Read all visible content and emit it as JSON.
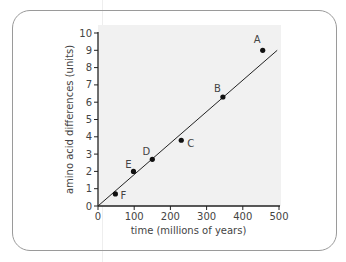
{
  "chart_data": {
    "type": "scatter",
    "title": "",
    "xlabel": "time (millions of years)",
    "ylabel": "amino acid differences (units)",
    "xlim": [
      0,
      500
    ],
    "ylim": [
      0,
      10
    ],
    "xticks": [
      0,
      100,
      200,
      300,
      400,
      500
    ],
    "yticks": [
      0,
      1,
      2,
      3,
      4,
      5,
      6,
      7,
      8,
      9,
      10
    ],
    "grid": false,
    "legend": null,
    "points": [
      {
        "label": "A",
        "x": 455,
        "y": 9.0
      },
      {
        "label": "B",
        "x": 345,
        "y": 6.3
      },
      {
        "label": "C",
        "x": 230,
        "y": 3.8
      },
      {
        "label": "D",
        "x": 150,
        "y": 2.7
      },
      {
        "label": "E",
        "x": 98,
        "y": 2.0
      },
      {
        "label": "F",
        "x": 48,
        "y": 0.7
      }
    ],
    "trendline": {
      "type": "linear",
      "from": {
        "x": 0,
        "y": 0
      },
      "to": {
        "x": 495,
        "y": 9.0
      }
    },
    "colors": {
      "points": "#111111",
      "line": "#222222",
      "plot_background": "#f1f1f1",
      "border": "#9a9a9a"
    }
  }
}
